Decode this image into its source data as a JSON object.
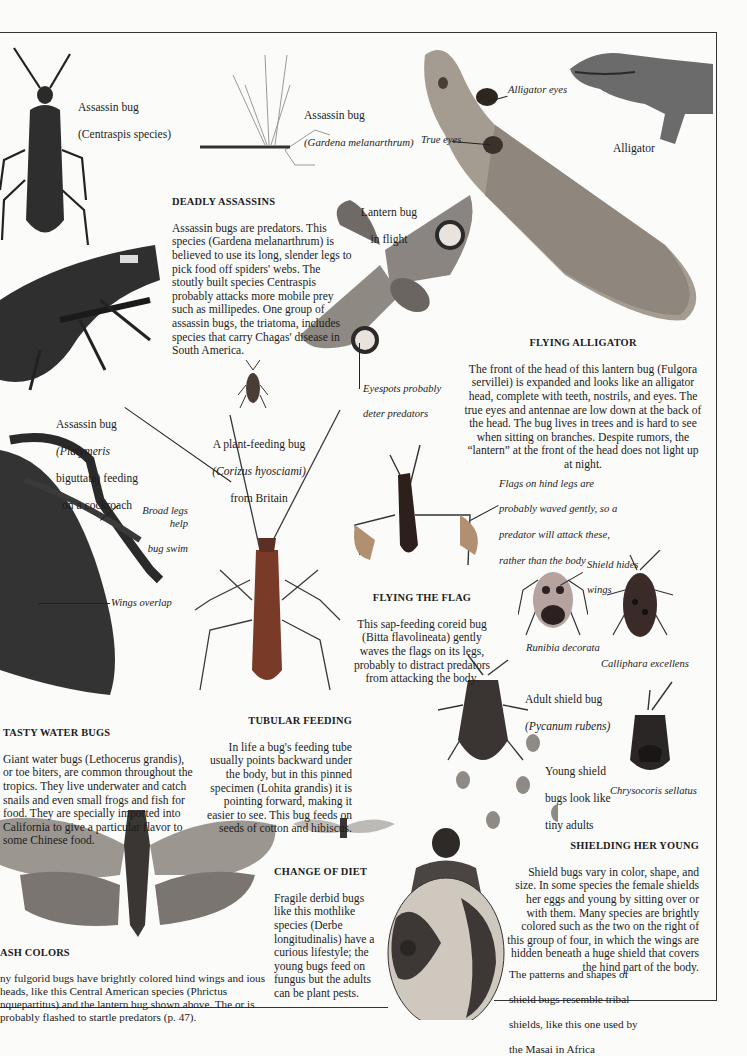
{
  "page": {
    "sections": {
      "deadly_assassins": {
        "heading": "DEADLY ASSASSINS",
        "body": "Assassin bugs are predators. This species (Gardena melanarthrum) is believed to use its long, slender legs to pick food off spiders' webs. The stoutly built species Centraspis probably attacks more mobile prey such as millipedes. One group of assassin bugs, the triatoma, includes species that carry Chagas' disease in South America."
      },
      "flying_alligator": {
        "heading": "FLYING ALLIGATOR",
        "body": "The front of the head of this lantern bug (Fulgora servillei) is expanded and looks like an alligator head, complete with teeth, nostrils, and eyes. The true eyes and antennae are low down at the back of the head. The bug lives in trees and is hard to see when sitting on branches. Despite rumors, the “lantern” at the front of the head does not light up at night."
      },
      "flying_the_flag": {
        "heading": "FLYING THE FLAG",
        "body": "This sap-feeding coreid bug (Bitta flavolineata) gently waves the flags on its legs, probably to distract predators from attacking the body."
      },
      "tasty_water_bugs": {
        "heading": "TASTY WATER BUGS",
        "body": "Giant water bugs (Lethocerus grandis), or toe biters, are common throughout the tropics. They live underwater and catch snails and even small frogs and fish for food. They are specially imported into California to give a particular flavor to some Chinese food."
      },
      "tubular_feeding": {
        "heading": "TUBULAR FEEDING",
        "body": "In life a bug's feeding tube usually points backward under the body, but in this pinned specimen (Lohita grandis) it is pointing forward, making it easier to see. This bug feeds on seeds of cotton and hibiscus."
      },
      "shielding_her_young": {
        "heading": "SHIELDING HER YOUNG",
        "body": "Shield bugs vary in color, shape, and size. In some species the female shields her eggs and young by sitting over or with them. Many species are brightly colored such as the two on the right of this group of four, in which the wings are hidden beneath a huge shield that covers the hind part of the body."
      },
      "change_of_diet": {
        "heading": "CHANGE OF DIET",
        "body": "Fragile derbid bugs like this mothlike species (Derbe longitudinalis) have a curious lifestyle; the young bugs feed on fungus but the adults can be plant pests."
      },
      "flash_colors": {
        "heading": "ASH COLORS",
        "body": "ny fulgorid bugs have brightly colored hind wings and ious heads, like this Central American species (Phrictus nquepartitus) and the lantern bug shown above. The or is probably flashed to startle predators (p. 47)."
      }
    },
    "captions": {
      "centraspis": [
        "Assassin bug",
        "(Centraspis species)"
      ],
      "gardena": [
        "Assassin bug",
        "(Gardena melanarthrum)"
      ],
      "alligator_eyes": "Alligator eyes",
      "true_eyes": "True eyes",
      "alligator": "Alligator",
      "lantern_bug_flight": [
        "Lantern bug",
        "in flight"
      ],
      "eyespots": [
        "Eyespots probably",
        "deter predators"
      ],
      "platymeris": [
        "Assassin bug",
        "(Platymeris",
        "biguttata) feeding",
        "on a cockroach"
      ],
      "corizus": [
        "A plant-feeding bug",
        "(Corizus hyosciami)",
        "from Britain"
      ],
      "broad_legs": [
        "Broad legs help",
        "bug swim"
      ],
      "wings_overlap": "Wings overlap",
      "flags_hind_legs": [
        "Flags on hind legs are",
        "probably waved gently, so a",
        "predator will attack these,",
        "rather than the  body"
      ],
      "shield_hides_wings": [
        "Shield hides",
        "wings"
      ],
      "runibia": "Runibia decorata",
      "calliphara": "Calliphara excellens",
      "pycanum": [
        "Adult shield bug",
        "(Pycanum rubens)"
      ],
      "young_shield": [
        "Young shield",
        "bugs look like",
        "tiny adults"
      ],
      "chrysocoris": "Chrysocoris sellatus",
      "masai": [
        "The patterns and shapes of",
        "shield bugs resemble tribal",
        "shields, like this one used by",
        "the Masai in Africa"
      ]
    },
    "images": [
      "centraspis-assassin-bug-photo",
      "gardena-assassin-bug-photo",
      "fulgora-lantern-bug-photo",
      "alligator-illustration",
      "lantern-bug-flight-illustration",
      "platymeris-feeding-on-cockroach-photo",
      "corizus-plant-bug-photo",
      "giant-water-bug-photo",
      "lohita-tubular-feeding-bug-photo",
      "bitta-flag-bug-photo",
      "runibia-shield-bug-photo",
      "calliphara-shield-bug-photo",
      "pycanum-shield-bug-photo",
      "young-shield-bugs-photo",
      "chrysocoris-shield-bug-photo",
      "phrictus-fulgorid-photo",
      "derbe-derbid-bug-photo",
      "masai-shield-photo"
    ]
  }
}
